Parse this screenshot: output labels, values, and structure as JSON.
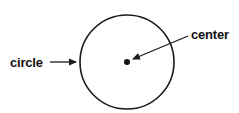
{
  "diagram": {
    "type": "labeled-geometry",
    "background": "#ffffff",
    "stroke_color": "#1a1a1a",
    "shape": {
      "kind": "circle",
      "cx": 127,
      "cy": 62,
      "r": 47
    },
    "center_point": {
      "cx": 127,
      "cy": 62,
      "r": 3
    },
    "labels": [
      {
        "id": "circle",
        "text": "circle",
        "x": 10,
        "y": 67,
        "arrow": {
          "x1": 50,
          "y1": 62,
          "x2": 76,
          "y2": 62
        }
      },
      {
        "id": "center",
        "text": "center",
        "x": 191,
        "y": 39,
        "arrow": {
          "x1": 188,
          "y1": 36,
          "x2": 133,
          "y2": 59
        }
      }
    ]
  }
}
